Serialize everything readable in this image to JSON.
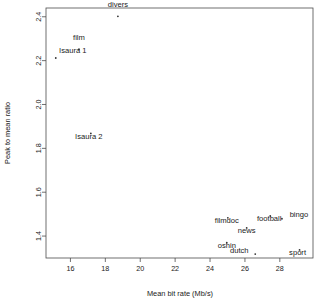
{
  "chart_data": {
    "type": "scatter",
    "title": "",
    "xlabel": "Mean bit rate (Mb/s)",
    "ylabel": "Peak to mean ratio",
    "xlim": [
      14.6,
      29.9
    ],
    "ylim": [
      1.3,
      2.44
    ],
    "xticks": [
      16,
      18,
      20,
      22,
      24,
      26,
      28
    ],
    "xtick_labels": [
      "16",
      "18",
      "20",
      "22",
      "24",
      "26",
      "28"
    ],
    "yticks": [
      1.4,
      1.6,
      1.8,
      2.0,
      2.2,
      2.4
    ],
    "ytick_labels": [
      "1.4",
      "1.6",
      "1.8",
      "2.0",
      "2.2",
      "2.4"
    ],
    "grid": false,
    "legend": false,
    "marker": "point",
    "marker_color": "#333333",
    "points": [
      {
        "label": "divers",
        "x": 18.72,
        "y": 2.402,
        "label_dx": 0,
        "label_dy": 9.5
      },
      {
        "label": "film",
        "x": 16.49,
        "y": 2.252,
        "label_dx": 0,
        "label_dy": 9.0
      },
      {
        "label": "Isaura 1",
        "x": 15.16,
        "y": 2.212,
        "label_dx": 17.0,
        "label_dy": 5.5
      },
      {
        "label": "Isaura 2",
        "x": 17.17,
        "y": 1.868,
        "label_dx": -2.0,
        "label_dy": -6.0
      },
      {
        "label": "filmdoc",
        "x": 25.02,
        "y": 1.483,
        "label_dx": -1.0,
        "label_dy": -5.0
      },
      {
        "label": "football",
        "x": 27.45,
        "y": 1.492,
        "label_dx": -1.0,
        "label_dy": -5.5
      },
      {
        "label": "bingo",
        "x": 28.12,
        "y": 1.479,
        "label_dx": 17.0,
        "label_dy": 2.0
      },
      {
        "label": "news",
        "x": 26.1,
        "y": 1.437,
        "label_dx": 0,
        "label_dy": -5.0
      },
      {
        "label": "oshin",
        "x": 24.96,
        "y": 1.37,
        "label_dx": 0,
        "label_dy": -5.0
      },
      {
        "label": "sport",
        "x": 29.13,
        "y": 1.337,
        "label_dx": -2.0,
        "label_dy": -5.0
      },
      {
        "label": "dutch",
        "x": 26.59,
        "y": 1.318,
        "label_dx": -16.0,
        "label_dy": 1.5
      }
    ]
  },
  "axes": {
    "x_title": "Mean bit rate (Mb/s)",
    "y_title": "Peak to mean ratio"
  }
}
